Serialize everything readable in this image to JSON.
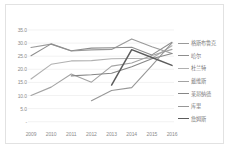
{
  "chart_data": {
    "type": "line",
    "title": "",
    "subtitle": "",
    "xlabel": "",
    "ylabel": "",
    "grid": true,
    "legend_position": "right",
    "x": [
      "2009",
      "2010",
      "2011",
      "2012",
      "2013",
      "2014",
      "2015",
      "2016"
    ],
    "xlim": [
      "2009",
      "2016"
    ],
    "ylim": [
      0,
      35
    ],
    "ytick_labels": [
      "-",
      "5.0",
      "10.0",
      "15.0",
      "20.0",
      "25.0",
      "30.0",
      "35.0"
    ],
    "ytick_values": [
      0,
      5,
      10,
      15,
      20,
      25,
      30,
      35
    ],
    "series": [
      {
        "name": "格斯布鲁克",
        "color": "#9a9a9a",
        "values": [
          28.3,
          29.6,
          27.0,
          27.4,
          27.6,
          31.6,
          28.6,
          26.0
        ]
      },
      {
        "name": "哈尔",
        "color": "#8e8e8e",
        "values": [
          25.2,
          29.7,
          27.1,
          28.1,
          28.2,
          28.4,
          25.5,
          30.3
        ]
      },
      {
        "name": "杜兰特",
        "color": "#b0b0b0",
        "values": [
          16.3,
          21.9,
          23.2,
          23.3,
          24.0,
          24.1,
          24.2,
          29.0
        ]
      },
      {
        "name": "戴维斯",
        "color": "#a3a3a3",
        "values": [
          10.0,
          13.2,
          18.2,
          15.1,
          21.2,
          22.4,
          25.3,
          27.6
        ]
      },
      {
        "name": "莱昂纳德",
        "color": "#868686",
        "values": [
          null,
          null,
          17.5,
          17.9,
          18.5,
          21.0,
          24.0,
          26.0
        ]
      },
      {
        "name": "库里",
        "color": "#979797",
        "values": [
          null,
          null,
          null,
          8.0,
          11.9,
          13.0,
          21.4,
          30.1
        ]
      },
      {
        "name": "詹姆斯",
        "color": "#5c5c5c",
        "values": [
          null,
          null,
          null,
          null,
          14.0,
          27.5,
          24.5,
          21.5
        ]
      }
    ]
  },
  "axis": {
    "y_labels": [
      "35.0",
      "30.0",
      "25.0",
      "20.0",
      "15.0",
      "10.0",
      "5.0",
      "-"
    ],
    "x_labels": [
      "2009",
      "2010",
      "2011",
      "2012",
      "2013",
      "2014",
      "2015",
      "2016"
    ]
  }
}
